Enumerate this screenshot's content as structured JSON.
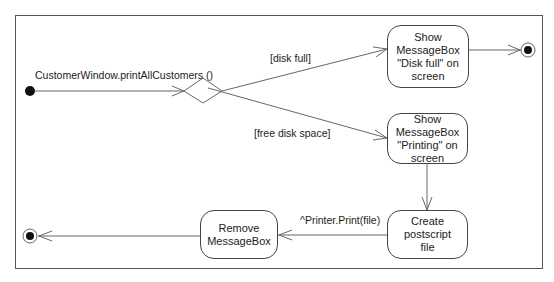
{
  "diagram": {
    "type": "UML activity diagram",
    "start_transition_label": "CustomerWindow.printAllCustomers ()",
    "guards": {
      "disk_full": "[disk full]",
      "free_space": "[free disk space]"
    },
    "activities": {
      "disk_full_msg": "Show\nMessageBox\n\"Disk full\" on\nscreen",
      "printing_msg": "Show\nMessageBox\n\"Printing\" on\nscreen",
      "create_postscript": "Create postscript\nfile",
      "remove_msgbox": "Remove\nMessageBox"
    },
    "send_event_label": "^Printer.Print(file)",
    "nodes": [
      "initial-node",
      "decision-node",
      "final-node-top",
      "final-node-bottom"
    ]
  }
}
